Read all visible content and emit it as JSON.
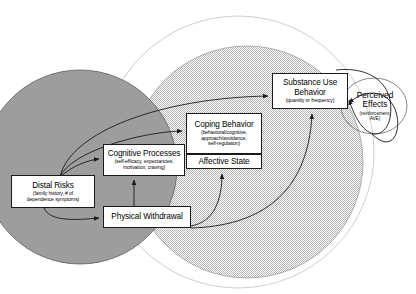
{
  "diagram": {
    "background_color": "#ffffff",
    "regions": [
      {
        "name": "distal-risk-domain",
        "shape": "circle",
        "fill": "#9a9a9a",
        "stroke": "#555555"
      },
      {
        "name": "proximal-process-domain",
        "shape": "circle",
        "fill": "#d8d8d8",
        "stroke": "#8a8a8a"
      },
      {
        "name": "context-domain",
        "shape": "circle",
        "fill": "#ffffff",
        "stroke": "#bdbdbd"
      }
    ],
    "nodes": {
      "substance_use": {
        "title": "Substance Use",
        "title2": "Behavior",
        "sub": "(quantity or frequency)"
      },
      "coping": {
        "title": "Coping Behavior",
        "sub_lines": [
          "(behavioral/cognitive,",
          "approach/avoidance,",
          "self-regulation)"
        ]
      },
      "cognitive": {
        "title": "Cognitive Processes",
        "sub_lines": [
          "(self-efficacy, expectancies,",
          "motivation, craving)"
        ]
      },
      "affective": {
        "title": "Affective State"
      },
      "distal": {
        "title": "Distal Risks",
        "sub_lines": [
          "(family history, # of",
          "dependence symptoms)"
        ]
      },
      "physical": {
        "title": "Physical Withdrawal"
      },
      "perceived": {
        "title": "Perceived",
        "title2": "Effects",
        "sub_lines": [
          "(reinforcement,",
          "AVE)"
        ]
      }
    },
    "edges": [
      {
        "name": "distal-to-substance-use",
        "from": "distal",
        "to": "substance_use",
        "style": "curved-arrow"
      },
      {
        "name": "distal-to-coping",
        "from": "distal",
        "to": "coping",
        "style": "curved-arrow"
      },
      {
        "name": "distal-to-cognitive",
        "from": "distal",
        "to": "cognitive",
        "style": "curved-arrow"
      },
      {
        "name": "distal-to-physical",
        "from": "distal",
        "to": "physical",
        "style": "curved-arrow"
      },
      {
        "name": "physical-to-cognitive",
        "from": "physical",
        "to": "cognitive",
        "style": "straight-arrow"
      },
      {
        "name": "physical-to-affective",
        "from": "physical",
        "to": "affective",
        "style": "curved-arrow"
      },
      {
        "name": "physical-to-substance-use",
        "from": "physical",
        "to": "substance_use",
        "style": "curved-arrow"
      },
      {
        "name": "substance-use-to-perceived",
        "from": "substance_use",
        "to": "perceived",
        "style": "curved-arrow"
      },
      {
        "name": "perceived-to-substance-use",
        "from": "perceived",
        "to": "substance_use",
        "style": "curved-arrow"
      }
    ]
  }
}
